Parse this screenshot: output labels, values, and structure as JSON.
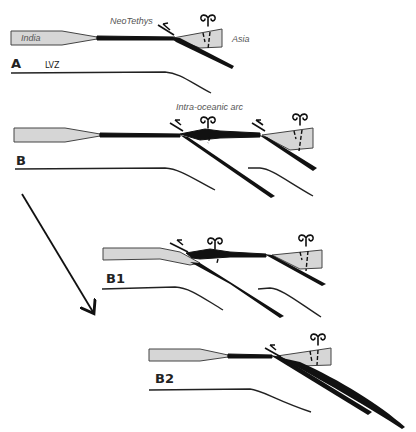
{
  "figure": {
    "panels": [
      {
        "id": "A",
        "label": "A",
        "annotations": {
          "india": "India",
          "ocean": "NeoTethys",
          "asia": "Asia",
          "lvz": "LVZ"
        }
      },
      {
        "id": "B",
        "label": "B",
        "annotations": {
          "arc": "Intra-oceanic arc"
        }
      },
      {
        "id": "B1",
        "label": "B1"
      },
      {
        "id": "B2",
        "label": "B2"
      }
    ],
    "colors": {
      "continental_crust": "#d6d6d6",
      "oceanic_lithosphere": "#111111",
      "outline": "#444444",
      "background": "#ffffff"
    },
    "arrow": {
      "from": "B",
      "to": "B2",
      "direction": "down-right"
    }
  }
}
